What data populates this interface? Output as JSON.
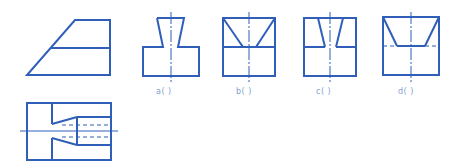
{
  "colors": {
    "line": "#2f5fb8",
    "label": "#7f9fcf",
    "background": "#ffffff"
  },
  "figures": {
    "given_view_top": {
      "description": "trapezoid view with horizontal mid line"
    },
    "given_view_bottom": {
      "description": "sectioned view with conical hole and dashed hidden lines"
    },
    "options": [
      {
        "id": "a",
        "label": "a(   )"
      },
      {
        "id": "b",
        "label": "b(   )"
      },
      {
        "id": "c",
        "label": "c(   )"
      },
      {
        "id": "d",
        "label": "d(   )"
      }
    ]
  }
}
